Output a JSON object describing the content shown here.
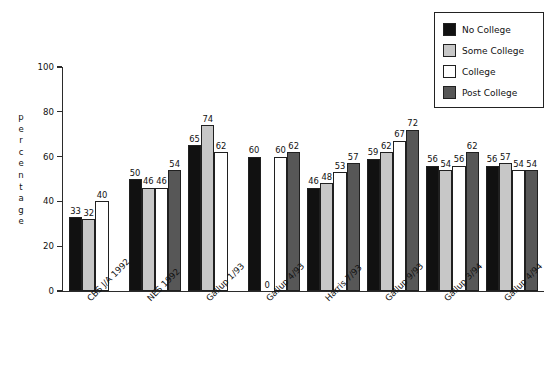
{
  "chart_data": {
    "type": "bar",
    "title": "",
    "xlabel": "",
    "ylabel": "percentage",
    "ylim": [
      0,
      100
    ],
    "yticks": [
      0,
      20,
      40,
      60,
      80,
      100
    ],
    "grid": false,
    "legend_position": "top-right",
    "categories": [
      "CBS J/A 1992",
      "NES 1992",
      "Gallup 1/93",
      "Gallup 4/93",
      "Harris 7/93",
      "Gallup 9/93",
      "Gallup 3/94",
      "Gallup 4/94"
    ],
    "series": [
      {
        "name": "No College",
        "color": "#111111",
        "values": [
          33,
          50,
          65,
          60,
          46,
          59,
          56,
          56
        ]
      },
      {
        "name": "Some College",
        "color": "#c7c7c7",
        "values": [
          32,
          46,
          74,
          0,
          48,
          62,
          54,
          57
        ]
      },
      {
        "name": "College",
        "color": "#ffffff",
        "values": [
          40,
          46,
          62,
          60,
          53,
          67,
          56,
          54
        ]
      },
      {
        "name": "Post College",
        "color": "#575757",
        "values": [
          null,
          54,
          null,
          62,
          57,
          72,
          62,
          54
        ]
      }
    ],
    "value_labels": {
      "CBS J/A 1992": [
        "33",
        "32",
        "40",
        ""
      ],
      "NES 1992": [
        "50",
        "46",
        "46",
        "54"
      ],
      "Gallup 1/93": [
        "65",
        "74",
        "62",
        ""
      ],
      "Gallup 4/93": [
        "60",
        "0",
        "60",
        "62"
      ],
      "Harris 7/93": [
        "46",
        "48",
        "53",
        "57"
      ],
      "Gallup 9/93": [
        "59",
        "62",
        "67",
        "72"
      ],
      "Gallup 3/94": [
        "56",
        "54",
        "56",
        "62"
      ],
      "Gallup 4/94": [
        "56",
        "57",
        "54",
        "54"
      ]
    }
  },
  "axis": {
    "y_title_letters": [
      "p",
      "e",
      "r",
      "c",
      "e",
      "n",
      "t",
      "a",
      "g",
      "e"
    ],
    "y_tick_labels": [
      "100",
      "80",
      "60",
      "40",
      "20",
      "0"
    ]
  },
  "legend": {
    "items": [
      {
        "label": "No College",
        "swatch": "s0"
      },
      {
        "label": "Some College",
        "swatch": "s1"
      },
      {
        "label": "College",
        "swatch": "s2"
      },
      {
        "label": "Post College",
        "swatch": "s3"
      }
    ]
  }
}
